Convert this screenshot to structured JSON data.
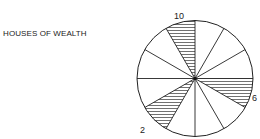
{
  "diagram": {
    "title": "HOUSES OF WEALTH",
    "house_count": 12,
    "highlighted_houses": [
      10,
      6,
      2
    ],
    "labels": [
      {
        "house": 10,
        "text": "10"
      },
      {
        "house": 6,
        "text": "6"
      },
      {
        "house": 2,
        "text": "2"
      }
    ],
    "colors": {
      "line": "#222222",
      "hatch": "#333333",
      "background": "#ffffff"
    }
  }
}
